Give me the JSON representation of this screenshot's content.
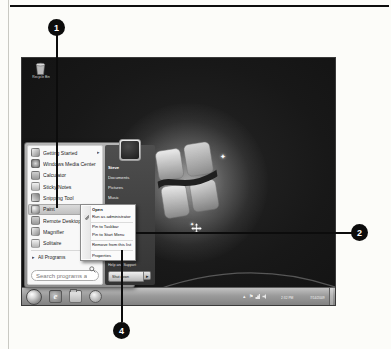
{
  "callouts": {
    "one": "1",
    "two": "2",
    "four": "4"
  },
  "icons": {
    "submenu_arrow": "▸",
    "all_programs_arrow": "▸",
    "shutdown_arrow": "▸",
    "tray_chevron": "▴",
    "flag": "⚑",
    "sparkle": "✦"
  },
  "desktop": {
    "recycle_bin_label": "Recycle Bin"
  },
  "start_menu": {
    "left_items": [
      {
        "label": "Getting Started",
        "icon": "getting-started-icon",
        "has_submenu": true
      },
      {
        "label": "Windows Media Center",
        "icon": "windows-media-center-icon"
      },
      {
        "label": "Calculator",
        "icon": "calculator-icon"
      },
      {
        "label": "Sticky Notes",
        "icon": "sticky-notes-icon"
      },
      {
        "label": "Snipping Tool",
        "icon": "snipping-tool-icon"
      },
      {
        "label": "Paint",
        "icon": "paint-icon",
        "highlighted": true
      },
      {
        "label": "Remote Desktop Connection",
        "icon": "remote-desktop-icon"
      },
      {
        "label": "Magnifier",
        "icon": "magnifier-icon"
      },
      {
        "label": "Solitaire",
        "icon": "solitaire-icon"
      }
    ],
    "all_programs_label": "All Programs",
    "search_placeholder": "Search programs and files",
    "right_items": [
      "Steve",
      "Documents",
      "Pictures",
      "Music"
    ],
    "help_label": "Help and Support",
    "shutdown_label": "Shut down"
  },
  "context_menu": {
    "items": [
      "Open",
      "Run as administrator",
      "Pin to Taskbar",
      "Pin to Start Menu",
      "Remove from this list",
      "Properties"
    ]
  },
  "taskbar": {
    "clock_time": "2:32 PM",
    "clock_date": "7/14/2009"
  },
  "colors": {
    "callout": "#0c0c0c",
    "taskbar_gray": "#9b9b9b",
    "start_menu_dark": "#3a3a3a",
    "highlight_gray": "#cfcfcf",
    "desktop_dark": "#181818"
  }
}
